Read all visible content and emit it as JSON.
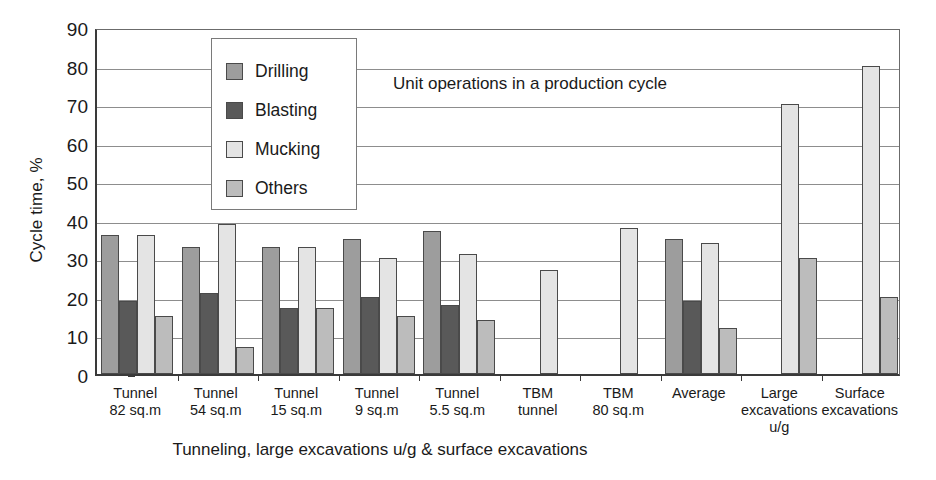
{
  "chart_data": {
    "type": "bar",
    "title": "Unit operations in a production cycle",
    "xlabel": "Tunneling, large excavations u/g & surface excavations",
    "ylabel": "Cycle time, %",
    "ylim": [
      0,
      90
    ],
    "yticks": [
      0,
      10,
      20,
      30,
      40,
      50,
      60,
      70,
      80,
      90
    ],
    "grid": true,
    "legend_position": "inside-top-left",
    "categories": [
      "Tunnel 82 sq.m",
      "Tunnel 54 sq.m",
      "Tunnel 15 sq.m",
      "Tunnel 9 sq.m",
      "Tunnel 5.5 sq.m",
      "TBM tunnel",
      "TBM 80 sq.m",
      "Average",
      "Large excavations u/g",
      "Surface excavations"
    ],
    "category_lines": [
      [
        "Tunnel",
        "82 sq.m"
      ],
      [
        "Tunnel",
        "54 sq.m"
      ],
      [
        "Tunnel",
        "15 sq.m"
      ],
      [
        "Tunnel",
        "9 sq.m"
      ],
      [
        "Tunnel",
        "5.5 sq.m"
      ],
      [
        "TBM",
        "tunnel"
      ],
      [
        "TBM",
        "80 sq.m"
      ],
      [
        "Average",
        ""
      ],
      [
        "Large",
        "excavations",
        "u/g"
      ],
      [
        "Surface",
        "excavations"
      ]
    ],
    "series": [
      {
        "name": "Drilling",
        "color": "#9d9d9d",
        "values": [
          36,
          33,
          33,
          35,
          37,
          null,
          null,
          35,
          null,
          null
        ]
      },
      {
        "name": "Blasting",
        "color": "#595959",
        "values": [
          19,
          21,
          17,
          20,
          18,
          null,
          null,
          19,
          null,
          null
        ]
      },
      {
        "name": "Mucking",
        "color": "#e4e4e4",
        "values": [
          36,
          39,
          33,
          30,
          31,
          27,
          38,
          34,
          70,
          80
        ]
      },
      {
        "name": "Others",
        "color": "#bcbcbc",
        "values": [
          15,
          7,
          17,
          15,
          14,
          null,
          null,
          12,
          30,
          20
        ]
      }
    ]
  }
}
